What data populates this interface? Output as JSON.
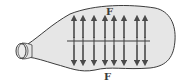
{
  "diagram": {
    "labels": {
      "top_force": "F",
      "bottom_force": "F"
    },
    "colors": {
      "balloon_fill": "#e6e6e6",
      "outline": "#3c3c3c",
      "arrow": "#4a4a4a",
      "background": "#ffffff"
    },
    "arrows": {
      "count_up": 8,
      "count_down": 8,
      "x_positions": [
        74,
        83,
        94,
        105,
        114,
        124,
        137,
        145
      ]
    },
    "cut_line": {
      "y": 41,
      "x_start": 67,
      "x_end": 150,
      "tick_count": 8
    }
  }
}
